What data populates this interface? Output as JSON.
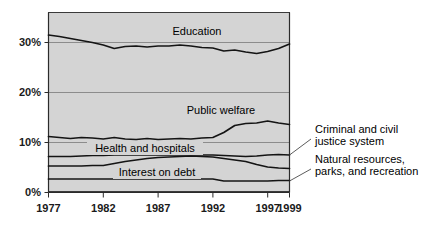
{
  "chart_data": {
    "type": "line",
    "title": "",
    "subtitle": "",
    "xlabel": "",
    "ylabel": "",
    "xlim": [
      1977,
      1999
    ],
    "ylim": [
      0,
      35
    ],
    "grid": true,
    "grid_axis": "y",
    "legend_position": "inline-annotations",
    "x_tick_labels": [
      "1977",
      "1982",
      "1987",
      "1992",
      "1997",
      "1999"
    ],
    "x_ticks": [
      1977,
      1982,
      1987,
      1992,
      1997,
      1999
    ],
    "y_tick_labels": [
      "0%",
      "10%",
      "20%",
      "30%"
    ],
    "y_ticks": [
      0,
      10,
      20,
      30
    ],
    "units": "percent of total direct general expenditure",
    "x": [
      1977,
      1978,
      1979,
      1980,
      1981,
      1982,
      1983,
      1984,
      1985,
      1986,
      1987,
      1988,
      1989,
      1990,
      1991,
      1992,
      1993,
      1994,
      1995,
      1996,
      1997,
      1998,
      1999
    ],
    "series": [
      {
        "name": "Education",
        "label": "Education",
        "values": [
          31.5,
          31.2,
          30.8,
          30.4,
          30.0,
          29.5,
          28.8,
          29.2,
          29.3,
          29.1,
          29.3,
          29.3,
          29.5,
          29.3,
          29.0,
          28.9,
          28.3,
          28.5,
          28.1,
          27.8,
          28.2,
          28.8,
          29.7
        ]
      },
      {
        "name": "Public welfare",
        "label": "Public welfare",
        "values": [
          11.2,
          11.0,
          10.8,
          11.0,
          10.9,
          10.7,
          11.0,
          10.7,
          10.6,
          10.8,
          10.6,
          10.7,
          10.8,
          10.7,
          10.9,
          11.0,
          12.0,
          13.4,
          13.8,
          13.9,
          14.3,
          13.9,
          13.6
        ]
      },
      {
        "name": "Health and hospitals",
        "label": "Health and hospitals",
        "values": [
          7.2,
          7.2,
          7.2,
          7.3,
          7.4,
          7.4,
          7.5,
          7.5,
          7.5,
          7.5,
          7.5,
          7.5,
          7.5,
          7.5,
          7.5,
          7.5,
          7.4,
          7.3,
          7.2,
          7.3,
          7.5,
          7.6,
          7.5
        ]
      },
      {
        "name": "Interest on debt",
        "label": "Interest on debt",
        "values": [
          5.3,
          5.3,
          5.3,
          5.3,
          5.4,
          5.4,
          5.8,
          6.2,
          6.5,
          6.8,
          7.0,
          7.1,
          7.2,
          7.3,
          7.2,
          7.1,
          6.8,
          6.5,
          6.2,
          5.6,
          5.1,
          4.9,
          4.8
        ]
      },
      {
        "name": "Natural resources, parks, and recreation",
        "label": "Natural resources, parks, and recreation",
        "values": [
          2.7,
          2.7,
          2.7,
          2.7,
          2.7,
          2.7,
          2.7,
          2.7,
          2.7,
          2.7,
          2.7,
          2.7,
          2.7,
          2.7,
          2.7,
          2.7,
          2.3,
          2.3,
          2.3,
          2.3,
          2.3,
          2.4,
          2.4
        ]
      }
    ],
    "inline_labels": [
      {
        "text": "Education",
        "series": "Education"
      },
      {
        "text": "Public welfare",
        "series": "Public welfare"
      },
      {
        "text": "Health and hospitals",
        "series": "Health and hospitals"
      },
      {
        "text": "Interest on debt",
        "series": "Interest on debt"
      }
    ],
    "callouts": [
      {
        "series": "Criminal and civil justice system",
        "line_1": "Criminal and civil",
        "line_2": "justice system"
      },
      {
        "series": "Natural resources, parks, and recreation",
        "line_1": "Natural resources,",
        "line_2": "parks, and recreation"
      }
    ],
    "colors": {
      "plot_background": "#d4d4d4",
      "line": "#141414",
      "gridline": "#8c8c8c",
      "axis": "#2b2b2b",
      "text": "#000000",
      "figure_background": "#ffffff"
    }
  },
  "axis": {
    "y_labels": [
      "30%",
      "20%",
      "10%",
      "0%"
    ],
    "x_labels": [
      "1977",
      "1982",
      "1987",
      "1992",
      "1997",
      "1999"
    ]
  },
  "labels": {
    "education": "Education",
    "public_welfare": "Public welfare",
    "health_and_hospitals": "Health and hospitals",
    "interest_on_debt": "Interest on debt",
    "criminal_justice_line1": "Criminal and civil",
    "criminal_justice_line2": "justice system",
    "natural_resources_line1": "Natural resources,",
    "natural_resources_line2": "parks, and recreation"
  }
}
